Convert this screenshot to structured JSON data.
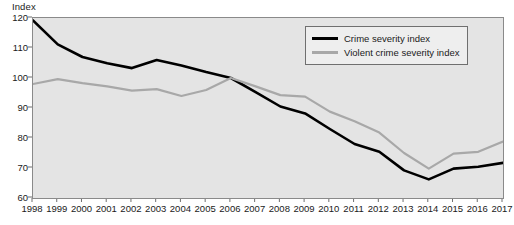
{
  "chart_data": {
    "type": "line",
    "title": "",
    "ylabel": "Index",
    "xlabel": "",
    "ylim": [
      60,
      120
    ],
    "ytick_step": 10,
    "yticks": [
      "120",
      "110",
      "100",
      "90",
      "80",
      "70",
      "60"
    ],
    "grid": false,
    "legend_position": "top-right",
    "categories": [
      "1998",
      "1999",
      "2000",
      "2001",
      "2002",
      "2003",
      "2004",
      "2005",
      "2006",
      "2007",
      "2008",
      "2009",
      "2010",
      "2011",
      "2012",
      "2013",
      "2014",
      "2015",
      "2016",
      "2017"
    ],
    "series": [
      {
        "name": "Crime severity index",
        "color": "#000000",
        "values": [
          119.2,
          111.2,
          107.0,
          104.9,
          103.3,
          106.0,
          104.2,
          102.0,
          100.0,
          95.3,
          90.5,
          88.2,
          83.0,
          78.0,
          75.4,
          69.2,
          66.2,
          69.8,
          70.4,
          71.7
        ]
      },
      {
        "name": "Violent crime severity index",
        "color": "#a8a8a8",
        "values": [
          98.0,
          99.6,
          98.3,
          97.2,
          95.8,
          96.3,
          94.0,
          96.0,
          100.0,
          97.2,
          94.3,
          93.8,
          88.8,
          85.6,
          81.8,
          75.0,
          69.8,
          74.8,
          75.4,
          78.8
        ]
      }
    ]
  }
}
